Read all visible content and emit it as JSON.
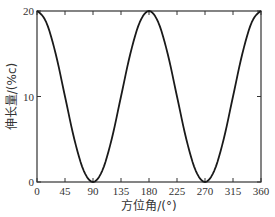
{
  "chart_data": {
    "type": "line",
    "title": "",
    "xlabel": "方位角/(°)",
    "ylabel": "伸长量/(%c)",
    "xlim": [
      0,
      360
    ],
    "ylim": [
      0,
      20
    ],
    "x_ticks": [
      0,
      45,
      90,
      135,
      180,
      225,
      270,
      315,
      360
    ],
    "y_ticks": [
      0,
      10,
      20
    ],
    "grid": false,
    "legend": null,
    "series": [
      {
        "name": "伸长量",
        "color": "#1a1a1a",
        "x": [
          0,
          15,
          30,
          45,
          60,
          75,
          90,
          105,
          120,
          135,
          150,
          165,
          180,
          195,
          210,
          225,
          240,
          255,
          270,
          285,
          300,
          315,
          330,
          345,
          360
        ],
        "values": [
          20,
          18.66,
          15,
          10,
          5,
          1.34,
          0,
          1.34,
          5,
          10,
          15,
          18.66,
          20,
          18.66,
          15,
          10,
          5,
          1.34,
          0,
          1.34,
          5,
          10,
          15,
          18.66,
          20
        ]
      }
    ]
  },
  "layout": {
    "plot_left": 37,
    "plot_right": 261,
    "plot_top": 11,
    "plot_bottom": 182
  }
}
